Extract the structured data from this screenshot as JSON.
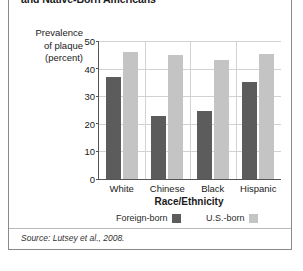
{
  "figure": {
    "title": "and Native-Born Americans",
    "source": "Source: Lutsey et al., 2008."
  },
  "legend": {
    "items": [
      {
        "label": "Foreign-born",
        "color": "#5c5c5c"
      },
      {
        "label": "U.S.-born",
        "color": "#c4c4c4"
      }
    ]
  },
  "chart_data": {
    "type": "bar",
    "title": "and Native-Born Americans",
    "xlabel": "Race/Ethnicity",
    "ylabel": "Prevalence of plaque (percent)",
    "ylabel_lines": [
      "Prevalence",
      "of plaque",
      "(percent)"
    ],
    "categories": [
      "White",
      "Chinese",
      "Black",
      "Hispanic"
    ],
    "series": [
      {
        "name": "Foreign-born",
        "color": "#5c5c5c",
        "values": [
          37,
          23,
          24.5,
          35
        ]
      },
      {
        "name": "U.S.-born",
        "color": "#c4c4c4",
        "values": [
          46,
          45,
          43,
          45.4
        ]
      }
    ],
    "ylim": [
      0,
      50
    ],
    "yticks": [
      0,
      10,
      20,
      30,
      40,
      50
    ],
    "grid": true,
    "legend_position": "bottom"
  }
}
